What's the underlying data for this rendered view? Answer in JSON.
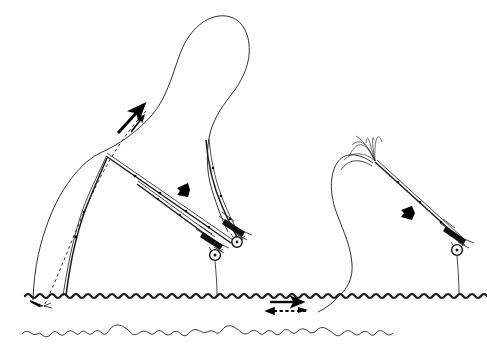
{
  "figure": {
    "background_color": "#ffffff",
    "ink_color": "#1a1a1a",
    "width": 487,
    "height": 350,
    "scene": {
      "water_surface_label": "water surface",
      "stream_bed_label": "stream bed",
      "water_line_y": 294,
      "bed_line_y": 330
    },
    "elements": [
      {
        "id": "left-sequence",
        "name": "left-casting-sequence",
        "label": "Left cast: back cast forming loop",
        "parts": [
          "rod-start",
          "rod-mid",
          "line-loop",
          "anchor-fly",
          "direction-arrows"
        ]
      },
      {
        "id": "right-sequence",
        "name": "right-casting-sequence",
        "label": "Right cast: forward stroke with rod tip track",
        "parts": [
          "rod-blank",
          "rod-tip-fan",
          "line-belly",
          "direction-arrow"
        ]
      }
    ],
    "arrows": [
      {
        "id": "arrow-up-thick",
        "name": "line-travel-arrow-up",
        "direction": "up-right",
        "style": "solid-thick"
      },
      {
        "id": "arrow-up-thin",
        "name": "line-travel-arrow-up-small",
        "direction": "up-right",
        "style": "solid-thin"
      },
      {
        "id": "arrow-rod-left",
        "name": "rod-travel-arrow-left",
        "direction": "left",
        "style": "solid-block"
      },
      {
        "id": "arrow-rod-right",
        "name": "rod-travel-arrow-right",
        "direction": "down-left",
        "style": "solid-block"
      },
      {
        "id": "arrow-current-solid",
        "name": "current-arrow-downstream",
        "direction": "right",
        "style": "solid"
      },
      {
        "id": "arrow-current-dashed",
        "name": "line-drift-arrow-upstream",
        "direction": "left",
        "style": "dashed"
      }
    ],
    "reels": [
      {
        "id": "reel-a",
        "name": "fly-reel-left"
      },
      {
        "id": "reel-b",
        "name": "fly-reel-mid"
      },
      {
        "id": "reel-c",
        "name": "fly-reel-right"
      }
    ],
    "flies": [
      {
        "id": "fly-left",
        "name": "fly-at-water-surface"
      }
    ]
  }
}
